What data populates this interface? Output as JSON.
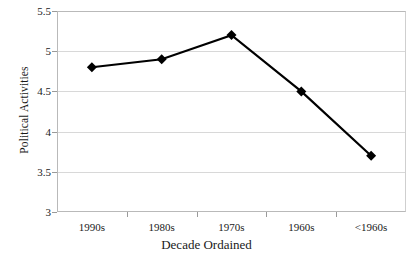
{
  "chart_data": {
    "type": "line",
    "title": "",
    "xlabel": "Decade Ordained",
    "ylabel": "Political Activities",
    "categories": [
      "1990s",
      "1980s",
      "1970s",
      "1960s",
      "<1960s"
    ],
    "values": [
      4.8,
      4.9,
      5.2,
      4.5,
      3.7
    ],
    "series": [
      {
        "name": "Political Activities",
        "values": [
          4.8,
          4.9,
          5.2,
          4.5,
          3.7
        ],
        "color": "#000000",
        "marker": "diamond"
      }
    ],
    "ylim": [
      3,
      5.5
    ],
    "yticks": [
      3,
      3.5,
      4,
      4.5,
      5,
      5.5
    ],
    "ytick_labels": [
      "3",
      "3.5",
      "4",
      "4.5",
      "5",
      "5.5"
    ],
    "grid": "horizontal",
    "legend": "none",
    "background": "#ffffff",
    "gridline_color": "#d8d8d8",
    "axis_color": "#b9b9b9"
  }
}
